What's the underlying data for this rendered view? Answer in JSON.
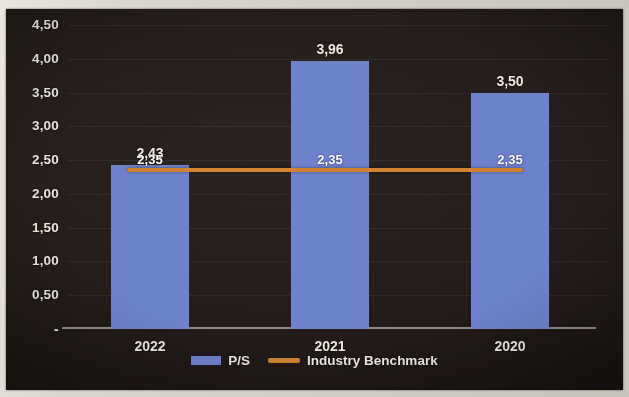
{
  "chart_data": {
    "type": "bar",
    "title": "",
    "xlabel": "",
    "ylabel": "",
    "categories": [
      "2022",
      "2021",
      "2020"
    ],
    "series": [
      {
        "name": "P/S",
        "type": "bar",
        "color": "#6e81cd",
        "values": [
          2.43,
          3.96,
          3.5
        ],
        "value_labels": [
          "2,43",
          "3,96",
          "3,50"
        ]
      },
      {
        "name": "Industry Benchmark",
        "type": "line",
        "color": "#cf8432",
        "values": [
          2.35,
          2.35,
          2.35
        ],
        "value_labels": [
          "2,35",
          "2,35",
          "2,35"
        ]
      }
    ],
    "ylim": [
      0,
      4.5
    ],
    "ytick_values": [
      4.5,
      4.0,
      3.5,
      3.0,
      2.5,
      2.0,
      1.5,
      1.0,
      0.5,
      0
    ],
    "ytick_labels": [
      "4,50",
      "4,00",
      "3,50",
      "3,00",
      "2,50",
      "2,00",
      "1,50",
      "1,00",
      "0,50",
      "-"
    ],
    "grid": true,
    "legend_position": "bottom",
    "note": "On the 2022 bar the P/S label 2,43 and the benchmark label 2,35 overlap."
  },
  "legend": {
    "items": [
      {
        "label": "P/S",
        "marker": "bar-swatch",
        "color": "#6e81cd"
      },
      {
        "label": "Industry Benchmark",
        "marker": "line-swatch",
        "color": "#cf8432"
      }
    ]
  },
  "colors": {
    "background": "#241d1b",
    "bar": "#6e81cd",
    "benchmark": "#cf8432",
    "text": "#f1ebe2"
  }
}
